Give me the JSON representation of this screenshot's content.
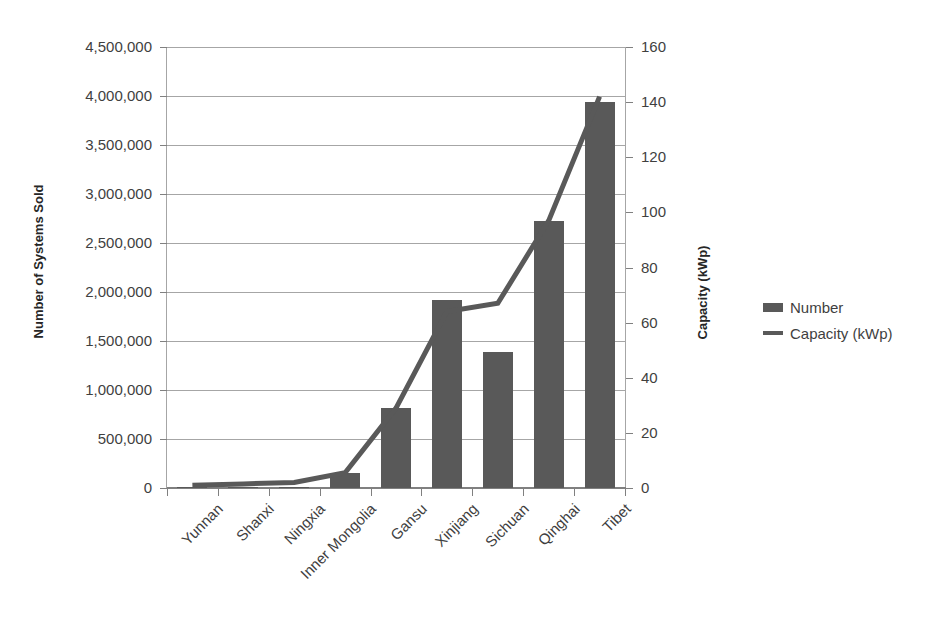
{
  "chart_data": {
    "type": "bar",
    "title": "",
    "categories": [
      "Yunnan",
      "Shanxi",
      "Ningxia",
      "Inner Mongolia",
      "Gansu",
      "Xinjiang",
      "Sichuan",
      "Qinghai",
      "Tibet"
    ],
    "series": [
      {
        "name": "Number",
        "type": "bar",
        "axis": "left",
        "values": [
          5000,
          8000,
          15000,
          150000,
          820000,
          1920000,
          1390000,
          2720000,
          3940000
        ]
      },
      {
        "name": "Capacity (kWp)",
        "type": "line",
        "axis": "right",
        "values": [
          1,
          1.5,
          2,
          5.5,
          29,
          64,
          67,
          97,
          142
        ]
      }
    ],
    "xlabel": "",
    "ylabel": "Number of Systems Sold",
    "y2label": "Capacity (kWp)",
    "ylim": [
      0,
      4500000
    ],
    "y2lim": [
      0,
      160
    ],
    "yticks": [
      0,
      500000,
      1000000,
      1500000,
      2000000,
      2500000,
      3000000,
      3500000,
      4000000,
      4500000
    ],
    "ytick_labels": [
      "0",
      "500,000",
      "1,000,000",
      "1,500,000",
      "2,000,000",
      "2,500,000",
      "3,000,000",
      "3,500,000",
      "4,000,000",
      "4,500,000"
    ],
    "y2ticks": [
      0,
      20,
      40,
      60,
      80,
      100,
      120,
      140,
      160
    ],
    "y2tick_labels": [
      "0",
      "20",
      "40",
      "60",
      "80",
      "100",
      "120",
      "140",
      "160"
    ],
    "grid": "horizontal",
    "legend_position": "right",
    "colors": {
      "bar": "#595959",
      "line": "#595959",
      "grid": "#a6a6a6",
      "axis": "#808080",
      "text": "#3f3f3f",
      "background": "#ffffff"
    }
  },
  "legend": {
    "items": [
      {
        "label": "Number",
        "marker": "bar-swatch"
      },
      {
        "label": "Capacity (kWp)",
        "marker": "line-swatch"
      }
    ]
  },
  "axes": {
    "left_title": "Number of Systems Sold",
    "right_title": "Capacity (kWp)"
  }
}
